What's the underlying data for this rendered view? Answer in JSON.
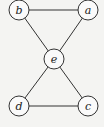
{
  "graph": {
    "nodes": [
      {
        "id": "b",
        "label": "b",
        "x": 19,
        "y": 10
      },
      {
        "id": "a",
        "label": "a",
        "x": 88,
        "y": 10
      },
      {
        "id": "e",
        "label": "e",
        "x": 54,
        "y": 59
      },
      {
        "id": "d",
        "label": "d",
        "x": 19,
        "y": 106
      },
      {
        "id": "c",
        "label": "c",
        "x": 88,
        "y": 106
      }
    ],
    "edges": [
      [
        "b",
        "a"
      ],
      [
        "b",
        "e"
      ],
      [
        "a",
        "e"
      ],
      [
        "e",
        "d"
      ],
      [
        "e",
        "c"
      ],
      [
        "d",
        "c"
      ]
    ],
    "node_radius": 10
  }
}
